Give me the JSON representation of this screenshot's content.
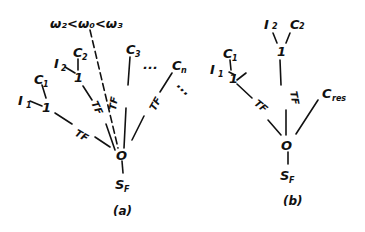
{
  "diagram_a": {
    "caption": "(a)",
    "root": "O",
    "root_child": "S",
    "root_child_sub": "F",
    "ordering": "ω₂<ω₀<ω₃",
    "node1_left": "1",
    "node1_mid": "1",
    "I1": "I",
    "I1_sub": "1",
    "C1": "C",
    "C1_sub": "1",
    "I2": "I",
    "I2_sub": "2",
    "C2": "C",
    "C2_sub": "2",
    "C3": "C",
    "C3_sub": "3",
    "Cn": "C",
    "Cn_sub": "n",
    "tf": "TF",
    "ellipsis": "..."
  },
  "diagram_b": {
    "caption": "(b)",
    "root": "O",
    "root_child": "S",
    "root_child_sub": "F",
    "node1_left": "1",
    "node1_top": "1",
    "I1": "I",
    "I1_sub": "1",
    "C1": "C",
    "C1_sub": "1",
    "I2": "I",
    "I2_sub": "2",
    "C2": "C",
    "C2_sub": "2",
    "Cres": "C",
    "Cres_sub": "res",
    "tf": "TF"
  }
}
